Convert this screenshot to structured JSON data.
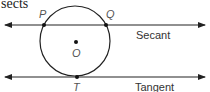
{
  "header_fragment": "sects",
  "diagram": {
    "circle": {
      "center_label": "O"
    },
    "points": {
      "p": "P",
      "q": "Q",
      "t": "T"
    },
    "lines": {
      "secant": {
        "label": "Secant"
      },
      "tangent": {
        "label": "Tangent"
      }
    }
  }
}
